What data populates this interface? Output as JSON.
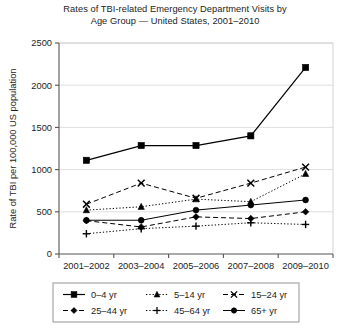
{
  "chart_data": {
    "type": "line",
    "title": "Rates of TBI-related Emergency Department Visits by Age Group — United States, 2001–2010",
    "title_line1": "Rates of TBI-related Emergency Department Visits by",
    "title_line2": "Age Group — United States, 2001–2010",
    "xlabel": "",
    "ylabel": "Rate of TBI per 100,000 US population",
    "categories": [
      "2001–2002",
      "2003–2004",
      "2005–2006",
      "2007–2008",
      "2009–2010"
    ],
    "ylim": [
      0,
      2500
    ],
    "yticks": [
      0,
      500,
      1000,
      1500,
      2000,
      2500
    ],
    "ytick_labels": [
      "0",
      "500",
      "1000",
      "1500",
      "2000",
      "2500"
    ],
    "grid": true,
    "legend_position": "bottom",
    "series": [
      {
        "name": "0–4 yr",
        "values": [
          1110,
          1285,
          1285,
          1400,
          2210
        ],
        "marker": "square",
        "line_style": "solid",
        "color": "#000000"
      },
      {
        "name": "5–14 yr",
        "values": [
          520,
          560,
          650,
          620,
          950
        ],
        "marker": "triangle",
        "line_style": "dotted",
        "color": "#000000"
      },
      {
        "name": "15–24 yr",
        "values": [
          590,
          840,
          660,
          840,
          1030
        ],
        "marker": "x",
        "line_style": "dashed",
        "color": "#000000"
      },
      {
        "name": "25–44 yr",
        "values": [
          395,
          320,
          440,
          420,
          500
        ],
        "marker": "diamond",
        "line_style": "dashed",
        "color": "#000000"
      },
      {
        "name": "45–64 yr",
        "values": [
          240,
          300,
          330,
          370,
          350
        ],
        "marker": "plus",
        "line_style": "dotted",
        "color": "#000000"
      },
      {
        "name": "65+ yr",
        "values": [
          400,
          400,
          520,
          580,
          640
        ],
        "marker": "circle",
        "line_style": "solid",
        "color": "#000000"
      }
    ]
  },
  "legend": {
    "rows": [
      [
        "0–4 yr",
        "5–14 yr",
        "15–24 yr"
      ],
      [
        "25–44 yr",
        "45–64 yr",
        "65+ yr"
      ]
    ]
  }
}
